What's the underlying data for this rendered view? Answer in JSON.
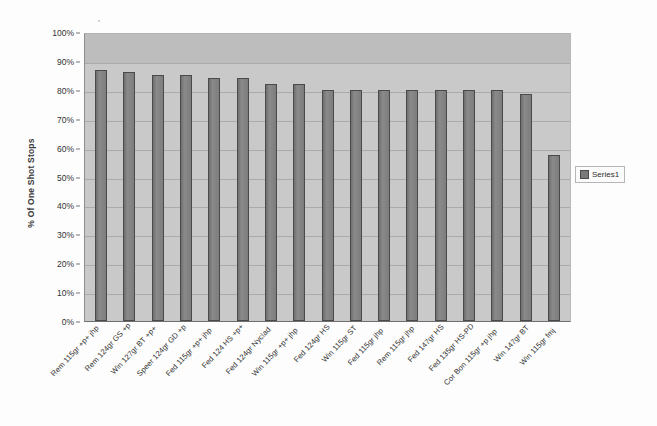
{
  "chart_data": {
    "type": "bar",
    "title": "",
    "subtitle": "",
    "xlabel": "",
    "ylabel": "% Of One Shot Stops",
    "ylim": [
      0,
      100
    ],
    "y_unit": "%",
    "grid": true,
    "legend_position": "right",
    "orientation": "vertical",
    "categories": [
      "Rem 115gr +p+ jhp",
      "Rem 124gr GS +p",
      "Win 127gr BT +p+",
      "Speer 124gr GD +p",
      "Fed 115gr +p+ jhp",
      "Fed 124 HS +p+",
      "Fed 124gr Nyclad",
      "Win 115gr +p+ jhp",
      "Fed 124gr HS",
      "Win 115gr ST",
      "Fed 115gr jhp",
      "Rem 115gr jhp",
      "Fed 147gr HS",
      "Fed 135gr HS-PD",
      "Cor Bon 115gr +p jhp",
      "Win 147gr BT",
      "Win 115gr fmj"
    ],
    "series": [
      {
        "name": "Series1",
        "values": [
          87,
          86,
          85,
          85,
          84,
          84,
          82,
          82,
          80,
          80,
          80,
          80,
          80,
          80,
          80,
          78.5,
          57.5
        ]
      }
    ],
    "ytick_labels": [
      "100%",
      "90%",
      "80%",
      "70%",
      "60%",
      "50%",
      "40%",
      "30%",
      "20%",
      "10%",
      "0%"
    ],
    "ytick_values": [
      100,
      90,
      80,
      70,
      60,
      50,
      40,
      30,
      20,
      10,
      0
    ],
    "colors": {
      "bar_fill": "#808080",
      "bar_border": "#4a4a4a",
      "plot_background": "#c9c9c9",
      "plot_band_90_100": "#bdbdbd",
      "gridline": "#aaaaaa",
      "page_background": "#ffffff",
      "text": "#2f2f2f"
    }
  },
  "legend": {
    "entries": [
      {
        "label": "Series1",
        "swatch_name": "series1-swatch"
      }
    ]
  }
}
